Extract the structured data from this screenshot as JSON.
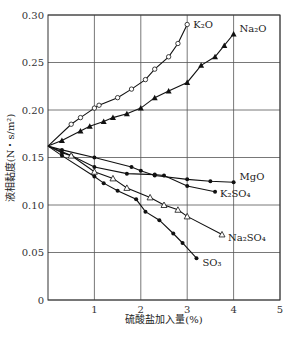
{
  "chart_data": {
    "type": "line",
    "title": "",
    "xlabel": "硫酸盐加入量(%)",
    "ylabel": "液相黏度(N・s/m²)",
    "xlim": [
      0,
      5
    ],
    "ylim": [
      0,
      0.3
    ],
    "xticks": [
      "1",
      "2",
      "3",
      "4",
      "5"
    ],
    "yticks": [
      "0",
      "0.05",
      "0.10",
      "0.15",
      "0.20",
      "0.25",
      "0.30"
    ],
    "grid": true,
    "legend": "inline labels at line ends",
    "series": [
      {
        "name": "K₂O",
        "label": "K₂O",
        "marker": "open-circle",
        "x": [
          0,
          0.5,
          0.7,
          1.0,
          1.1,
          1.5,
          1.8,
          2.1,
          2.3,
          2.6,
          2.8,
          3.0
        ],
        "y": [
          0.162,
          0.185,
          0.192,
          0.202,
          0.205,
          0.213,
          0.222,
          0.232,
          0.243,
          0.256,
          0.27,
          0.29
        ]
      },
      {
        "name": "Na₂O",
        "label": "Na₂O",
        "marker": "filled-triangle",
        "x": [
          0,
          0.3,
          0.7,
          0.9,
          1.2,
          1.4,
          1.7,
          2.0,
          2.3,
          2.6,
          3.0,
          3.3,
          3.6,
          3.8,
          4.0
        ],
        "y": [
          0.162,
          0.168,
          0.178,
          0.183,
          0.188,
          0.192,
          0.196,
          0.202,
          0.213,
          0.22,
          0.229,
          0.247,
          0.256,
          0.268,
          0.28
        ]
      },
      {
        "name": "MgO",
        "label": "MgO",
        "marker": "filled-dot",
        "x": [
          0,
          0.3,
          1.0,
          1.8,
          2.0,
          2.3,
          3.0,
          3.5,
          4.0
        ],
        "y": [
          0.162,
          0.158,
          0.15,
          0.14,
          0.136,
          0.131,
          0.127,
          0.125,
          0.124
        ]
      },
      {
        "name": "K₂SO₄",
        "label": "K₂SO₄",
        "marker": "filled-dot",
        "x": [
          0,
          0.3,
          0.5,
          1.0,
          1.7,
          2.3,
          2.5,
          3.0,
          3.6
        ],
        "y": [
          0.162,
          0.155,
          0.152,
          0.14,
          0.133,
          0.132,
          0.131,
          0.12,
          0.114
        ]
      },
      {
        "name": "Na₂SO₄",
        "label": "Na₂SO₄",
        "marker": "open-triangle",
        "x": [
          0,
          0.5,
          1.0,
          1.4,
          1.7,
          2.2,
          2.5,
          2.8,
          3.0,
          3.75
        ],
        "y": [
          0.162,
          0.152,
          0.135,
          0.128,
          0.118,
          0.108,
          0.1,
          0.095,
          0.088,
          0.069
        ]
      },
      {
        "name": "SO₃",
        "label": "SO₃",
        "marker": "filled-dot",
        "x": [
          0,
          0.3,
          1.0,
          1.2,
          1.5,
          1.9,
          2.1,
          2.4,
          2.7,
          2.9,
          3.2
        ],
        "y": [
          0.162,
          0.152,
          0.13,
          0.123,
          0.115,
          0.106,
          0.093,
          0.084,
          0.07,
          0.06,
          0.044
        ]
      }
    ]
  }
}
